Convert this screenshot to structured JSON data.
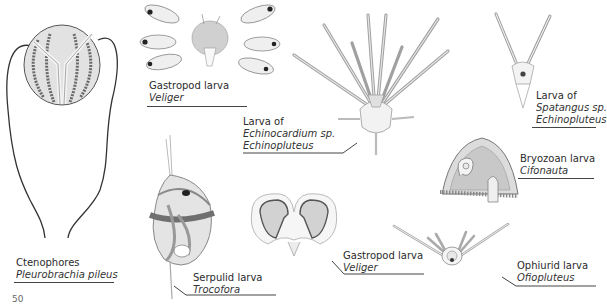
{
  "page": {
    "page_number": "50"
  },
  "figures": [
    {
      "id": "ctenophores",
      "common": "Ctenophores",
      "scientific": [
        "Pleurobrachia pileus"
      ]
    },
    {
      "id": "gastropod-veliger-top",
      "common": "Gastropod larva",
      "scientific": [
        "Veliger"
      ]
    },
    {
      "id": "echinocardium",
      "common": "Larva of",
      "scientific": [
        "Echinocardium sp.",
        "Echinopluteus"
      ]
    },
    {
      "id": "spatangus",
      "common": "Larva of",
      "scientific": [
        "Spatangus sp.",
        "Echinopluteus"
      ]
    },
    {
      "id": "bryozoan",
      "common": "Bryozoan larva",
      "scientific": [
        "Cifonauta"
      ]
    },
    {
      "id": "serpulid",
      "common": "Serpulid larva",
      "scientific": [
        "Trocofora"
      ]
    },
    {
      "id": "gastropod-veliger-bottom",
      "common": "Gastropod larva",
      "scientific": [
        "Veliger"
      ]
    },
    {
      "id": "ophiurid",
      "common": "Ophiurid larva",
      "scientific": [
        "Ofiopluteus"
      ]
    }
  ],
  "colors": {
    "ink": "#3a3a3a",
    "wash": "#d8d8d8",
    "shade": "#a8a8a8",
    "stripe": "#7a7a7a",
    "dark_band": "#6f6f6f"
  }
}
